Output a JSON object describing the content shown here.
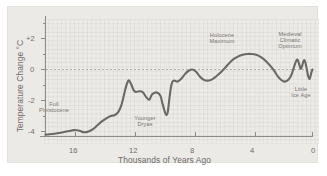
{
  "chart_data": {
    "type": "line",
    "title": "",
    "subtitle": "",
    "xlabel": "Thousands of Years Ago",
    "ylabel": "Temperature Change °C",
    "xlim": [
      18,
      0
    ],
    "ylim": [
      -5,
      3
    ],
    "x_ticks": [
      16,
      12,
      8,
      4,
      0
    ],
    "x_tick_labels": [
      "16",
      "12",
      "8",
      "4",
      "0"
    ],
    "y_ticks": [
      2,
      0,
      -2,
      -4
    ],
    "y_tick_labels": [
      "+2",
      "0",
      "-2",
      "-4"
    ],
    "x_axis_direction": "decreasing",
    "grid": "fine graph-paper grid, zero-line dashed",
    "legend": "none",
    "line_color": "#6b6964",
    "background_color": "#edebe7",
    "panel_color": "#eceae6",
    "series": [
      {
        "name": "Temperature Change",
        "points": [
          [
            18.0,
            -4.2
          ],
          [
            17.4,
            -4.15
          ],
          [
            16.8,
            -4.05
          ],
          [
            16.3,
            -3.95
          ],
          [
            16.0,
            -3.9
          ],
          [
            15.7,
            -3.95
          ],
          [
            15.4,
            -4.05
          ],
          [
            15.1,
            -4.0
          ],
          [
            14.8,
            -3.85
          ],
          [
            14.5,
            -3.6
          ],
          [
            14.2,
            -3.35
          ],
          [
            13.9,
            -3.15
          ],
          [
            13.6,
            -3.0
          ],
          [
            13.35,
            -2.95
          ],
          [
            13.1,
            -2.75
          ],
          [
            12.9,
            -2.35
          ],
          [
            12.75,
            -1.8
          ],
          [
            12.6,
            -1.2
          ],
          [
            12.45,
            -0.78
          ],
          [
            12.35,
            -0.72
          ],
          [
            12.2,
            -1.0
          ],
          [
            12.05,
            -1.35
          ],
          [
            11.9,
            -1.45
          ],
          [
            11.7,
            -1.4
          ],
          [
            11.45,
            -1.45
          ],
          [
            11.2,
            -1.8
          ],
          [
            11.0,
            -1.95
          ],
          [
            10.85,
            -1.65
          ],
          [
            10.65,
            -1.5
          ],
          [
            10.45,
            -1.5
          ],
          [
            10.25,
            -1.7
          ],
          [
            10.1,
            -2.25
          ],
          [
            9.95,
            -2.75
          ],
          [
            9.85,
            -2.95
          ],
          [
            9.75,
            -2.7
          ],
          [
            9.65,
            -1.9
          ],
          [
            9.55,
            -1.2
          ],
          [
            9.45,
            -0.8
          ],
          [
            9.3,
            -0.72
          ],
          [
            9.1,
            -0.78
          ],
          [
            8.85,
            -0.6
          ],
          [
            8.6,
            -0.3
          ],
          [
            8.35,
            -0.08
          ],
          [
            8.1,
            0.0
          ],
          [
            7.85,
            -0.15
          ],
          [
            7.6,
            -0.45
          ],
          [
            7.35,
            -0.65
          ],
          [
            7.1,
            -0.72
          ],
          [
            6.8,
            -0.65
          ],
          [
            6.5,
            -0.45
          ],
          [
            6.2,
            -0.2
          ],
          [
            5.9,
            0.1
          ],
          [
            5.6,
            0.42
          ],
          [
            5.3,
            0.68
          ],
          [
            5.0,
            0.85
          ],
          [
            4.7,
            0.95
          ],
          [
            4.4,
            1.0
          ],
          [
            4.1,
            1.0
          ],
          [
            3.8,
            0.95
          ],
          [
            3.5,
            0.82
          ],
          [
            3.2,
            0.6
          ],
          [
            2.9,
            0.3
          ],
          [
            2.6,
            -0.05
          ],
          [
            2.35,
            -0.42
          ],
          [
            2.1,
            -0.68
          ],
          [
            1.9,
            -0.78
          ],
          [
            1.7,
            -0.72
          ],
          [
            1.5,
            -0.5
          ],
          [
            1.35,
            -0.15
          ],
          [
            1.2,
            0.3
          ],
          [
            1.08,
            0.6
          ],
          [
            1.0,
            0.62
          ],
          [
            0.9,
            0.35
          ],
          [
            0.8,
            0.05
          ],
          [
            0.72,
            0.18
          ],
          [
            0.62,
            0.5
          ],
          [
            0.55,
            0.6
          ],
          [
            0.47,
            0.42
          ],
          [
            0.38,
            0.0
          ],
          [
            0.3,
            -0.4
          ],
          [
            0.22,
            -0.6
          ],
          [
            0.15,
            -0.5
          ],
          [
            0.08,
            -0.2
          ],
          [
            0.0,
            0.0
          ]
        ]
      }
    ],
    "annotations": [
      {
        "id": "full-pleistocene",
        "text": "Full\nPleistocene",
        "x": 16.0,
        "y": -3.2
      },
      {
        "id": "younger-dryas",
        "text": "Younger\nDryas",
        "x": 9.8,
        "y": -3.5
      },
      {
        "id": "holocene-maximum",
        "text": "Holocene\nMaximum",
        "x": 4.9,
        "y": 1.85
      },
      {
        "id": "medieval-climatic-optimum",
        "text": "Medieval\nClimatic\nOptimum",
        "x": 1.05,
        "y": 1.9
      },
      {
        "id": "little-ice-age",
        "text": "Little\nIce Age",
        "x": 0.35,
        "y": -1.45
      }
    ]
  }
}
